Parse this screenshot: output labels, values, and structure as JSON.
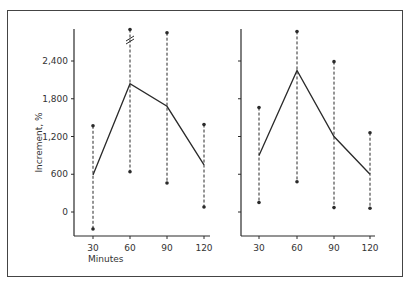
{
  "chart_data": [
    {
      "type": "line",
      "panel": "left",
      "title": "",
      "xlabel": "Minutes",
      "ylabel": "Increment, %",
      "x": [
        30,
        60,
        90,
        120
      ],
      "x_tick_labels": [
        "30",
        "60",
        "90",
        "120"
      ],
      "y_tick_values": [
        0,
        600,
        1200,
        1800,
        2400
      ],
      "y_tick_labels": [
        "0",
        "600",
        "1,200",
        "1,800",
        "2,400"
      ],
      "ylim": [
        -400,
        3000
      ],
      "grid": false,
      "series": [
        {
          "name": "mean",
          "values": [
            590,
            2040,
            1680,
            750
          ]
        },
        {
          "name": "range_high",
          "values": [
            1370,
            2900,
            2850,
            1390
          ]
        },
        {
          "name": "range_low",
          "values": [
            -270,
            640,
            460,
            80
          ]
        }
      ],
      "annotations": [
        "axis break mark on 60-min range line"
      ]
    },
    {
      "type": "line",
      "panel": "right",
      "title": "",
      "xlabel": "",
      "ylabel": "",
      "x": [
        30,
        60,
        90,
        120
      ],
      "x_tick_labels": [
        "30",
        "60",
        "90",
        "120"
      ],
      "y_tick_values": [
        0,
        600,
        1200,
        1800,
        2400
      ],
      "y_tick_labels": [],
      "ylim": [
        -400,
        3000
      ],
      "grid": false,
      "series": [
        {
          "name": "mean",
          "values": [
            900,
            2250,
            1200,
            600
          ]
        },
        {
          "name": "range_high",
          "values": [
            1660,
            2870,
            2390,
            1260
          ]
        },
        {
          "name": "range_low",
          "values": [
            150,
            480,
            70,
            60
          ]
        }
      ]
    }
  ],
  "colors": {
    "line": "#2a2a2a",
    "frame": "#444444",
    "text": "#333333"
  }
}
